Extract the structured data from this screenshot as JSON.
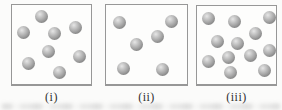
{
  "figure": {
    "background": "#fbfbfa",
    "box_fill": "#fdfdfc",
    "box_border": "#979797",
    "label_color": "#2f2f2f",
    "particle_style": {
      "diameter": 13,
      "highlight": "#e6e6e6",
      "mid": "#a2a2a2",
      "edge": "#6b6b6b"
    },
    "panels": [
      {
        "label": "(i)",
        "particle_count": 8,
        "box": {
          "x": 11,
          "y": 4,
          "w": 81,
          "h": 82
        },
        "particles": [
          {
            "x": 30,
            "y": 12
          },
          {
            "x": 12,
            "y": 28
          },
          {
            "x": 43,
            "y": 29
          },
          {
            "x": 64,
            "y": 23
          },
          {
            "x": 37,
            "y": 47
          },
          {
            "x": 68,
            "y": 52
          },
          {
            "x": 17,
            "y": 59
          },
          {
            "x": 48,
            "y": 68
          }
        ]
      },
      {
        "label": "(ii)",
        "particle_count": 6,
        "box": {
          "x": 105,
          "y": 4,
          "w": 83,
          "h": 82
        },
        "particles": [
          {
            "x": 14,
            "y": 18
          },
          {
            "x": 66,
            "y": 17
          },
          {
            "x": 52,
            "y": 32
          },
          {
            "x": 31,
            "y": 40
          },
          {
            "x": 18,
            "y": 64
          },
          {
            "x": 57,
            "y": 65
          }
        ]
      },
      {
        "label": "(iii)",
        "particle_count": 12,
        "box": {
          "x": 196,
          "y": 5,
          "w": 81,
          "h": 81
        },
        "particles": [
          {
            "x": 12,
            "y": 13
          },
          {
            "x": 38,
            "y": 16
          },
          {
            "x": 73,
            "y": 12
          },
          {
            "x": 59,
            "y": 28
          },
          {
            "x": 21,
            "y": 36
          },
          {
            "x": 41,
            "y": 38
          },
          {
            "x": 73,
            "y": 45
          },
          {
            "x": 32,
            "y": 52
          },
          {
            "x": 54,
            "y": 50
          },
          {
            "x": 12,
            "y": 56
          },
          {
            "x": 34,
            "y": 67
          },
          {
            "x": 68,
            "y": 65
          }
        ]
      }
    ]
  }
}
